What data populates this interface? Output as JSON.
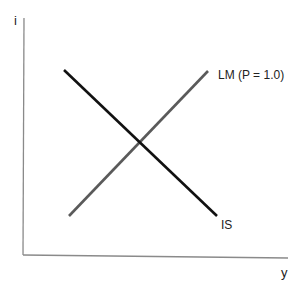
{
  "diagram": {
    "axes": {
      "y_label": "i",
      "x_label": "y"
    },
    "curves": [
      {
        "name": "IS",
        "label": "IS",
        "color": "#111111",
        "from": [
          64,
          70
        ],
        "to": [
          217,
          216
        ]
      },
      {
        "name": "LM",
        "label": "LM (P = 1.0)",
        "color": "#5a5a5a",
        "from": [
          69,
          216
        ],
        "to": [
          208,
          71
        ]
      }
    ],
    "colors": {
      "axis": "#8a8a8a",
      "text": "#222222"
    }
  }
}
